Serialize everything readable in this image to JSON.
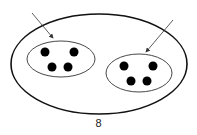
{
  "diagram": {
    "caption": "8",
    "outer_set": {
      "cx": 99,
      "cy": 64,
      "rx": 88,
      "ry": 50
    },
    "subsets": [
      {
        "name": "left",
        "cx": 61,
        "cy": 59,
        "rx": 34,
        "ry": 18,
        "dots": [
          [
            45,
            52
          ],
          [
            74,
            52
          ],
          [
            52,
            67
          ],
          [
            68,
            67
          ]
        ],
        "arrow": {
          "x1": 32,
          "y1": 13,
          "x2": 53,
          "y2": 38
        }
      },
      {
        "name": "right",
        "cx": 139,
        "cy": 73,
        "rx": 33,
        "ry": 19,
        "dots": [
          [
            124,
            66
          ],
          [
            153,
            66
          ],
          [
            131,
            81
          ],
          [
            147,
            81
          ]
        ],
        "arrow": {
          "x1": 173,
          "y1": 20,
          "x2": 146,
          "y2": 52
        }
      }
    ],
    "stroke_color": "#111111"
  }
}
